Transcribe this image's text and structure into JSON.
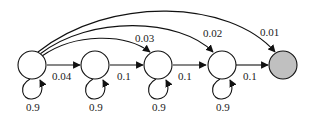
{
  "diagram": {
    "type": "markov-chain",
    "nodes": [
      {
        "id": "s1",
        "fill": "#ffffff"
      },
      {
        "id": "s2",
        "fill": "#ffffff"
      },
      {
        "id": "s3",
        "fill": "#ffffff"
      },
      {
        "id": "s4",
        "fill": "#ffffff"
      },
      {
        "id": "s5",
        "fill": "#c0c0c0"
      }
    ],
    "edges": [
      {
        "from": "s1",
        "to": "s2",
        "label": "0.04"
      },
      {
        "from": "s2",
        "to": "s3",
        "label": "0.1"
      },
      {
        "from": "s3",
        "to": "s4",
        "label": "0.1"
      },
      {
        "from": "s4",
        "to": "s5",
        "label": "0.1"
      },
      {
        "from": "s1",
        "to": "s3",
        "label": "0.03"
      },
      {
        "from": "s1",
        "to": "s4",
        "label": "0.02"
      },
      {
        "from": "s1",
        "to": "s5",
        "label": "0.01"
      }
    ],
    "self_loops": [
      {
        "node": "s1",
        "label": "0.9"
      },
      {
        "node": "s2",
        "label": "0.9"
      },
      {
        "node": "s3",
        "label": "0.9"
      },
      {
        "node": "s4",
        "label": "0.9"
      }
    ]
  }
}
